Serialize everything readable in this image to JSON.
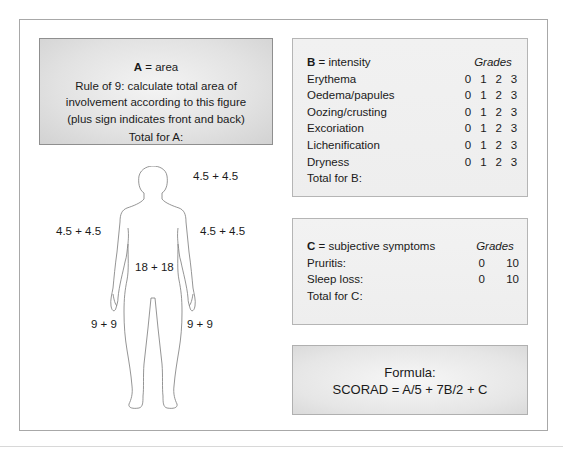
{
  "box_a": {
    "letter": "A",
    "title_rest": " = area",
    "lines": [
      "Rule of 9: calculate total area of",
      "involvement according to this figure",
      "(plus sign indicates front and back)"
    ],
    "total": "Total for A:"
  },
  "body_labels": {
    "head": "4.5 + 4.5",
    "left_arm": "4.5 + 4.5",
    "right_arm": "4.5 + 4.5",
    "trunk": "18 + 18",
    "left_leg": "9 + 9",
    "right_leg": "9 + 9"
  },
  "box_b": {
    "letter": "B",
    "title_rest": " = intensity",
    "grades_header": "Grades",
    "items": [
      {
        "label": "Erythema",
        "grades": [
          "0",
          "1",
          "2",
          "3"
        ]
      },
      {
        "label": "Oedema/papules",
        "grades": [
          "0",
          "1",
          "2",
          "3"
        ]
      },
      {
        "label": "Oozing/crusting",
        "grades": [
          "0",
          "1",
          "2",
          "3"
        ]
      },
      {
        "label": "Excoriation",
        "grades": [
          "0",
          "1",
          "2",
          "3"
        ]
      },
      {
        "label": "Lichenification",
        "grades": [
          "0",
          "1",
          "2",
          "3"
        ]
      },
      {
        "label": "Dryness",
        "grades": [
          "0",
          "1",
          "2",
          "3"
        ]
      }
    ],
    "total": "Total for B:"
  },
  "box_c": {
    "letter": "C",
    "title_rest": " = subjective symptoms",
    "grades_header": "Grades",
    "items": [
      {
        "label": "Pruritis:",
        "grades": [
          "0",
          "10"
        ]
      },
      {
        "label": "Sleep loss:",
        "grades": [
          "0",
          "10"
        ]
      }
    ],
    "total": "Total for C:"
  },
  "formula": {
    "title": "Formula:",
    "expression": "SCORAD = A/5 + 7B/2 + C"
  }
}
